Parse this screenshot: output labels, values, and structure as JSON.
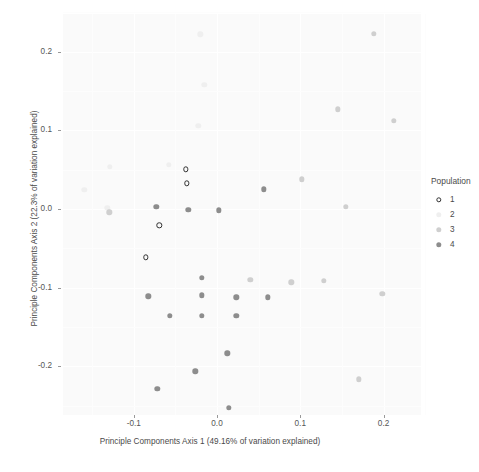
{
  "chart_data": {
    "type": "scatter",
    "title": "",
    "xlabel": "Principle Components Axis 1 (49.16% of variation explained)",
    "ylabel": "Principle Components Axis 2 (22.3% of variation explained)",
    "xlim": [
      -0.185,
      0.245
    ],
    "ylim": [
      -0.262,
      0.248
    ],
    "xticks": [
      -0.1,
      0.0,
      0.1,
      0.2
    ],
    "xticklabels": [
      "-0.1",
      "0.0",
      "0.1",
      "0.2"
    ],
    "yticks": [
      0.2,
      0.1,
      0.0,
      -0.1,
      -0.2
    ],
    "yticklabels": [
      "0.2",
      "0.1",
      "0.0",
      "-0.1",
      "-0.2"
    ],
    "grid": true,
    "legend": {
      "title": "Population",
      "position": "right",
      "entries": [
        {
          "label": "1",
          "marker": "open-circle",
          "color": "#303030"
        },
        {
          "label": "2",
          "marker": "filled-circle",
          "color": "#efefef"
        },
        {
          "label": "3",
          "marker": "filled-circle",
          "color": "#cfcfcf"
        },
        {
          "label": "4",
          "marker": "filled-circle",
          "color": "#8d8d8d"
        }
      ]
    },
    "series": [
      {
        "name": "1",
        "marker": "open-circle",
        "color": "#303030",
        "points": [
          {
            "x": -0.0375,
            "y": 0.0505
          },
          {
            "x": -0.0365,
            "y": 0.0325
          },
          {
            "x": -0.0695,
            "y": -0.0205
          },
          {
            "x": -0.0855,
            "y": -0.0615
          }
        ]
      },
      {
        "name": "2",
        "marker": "filled-circle",
        "color": "#efefef",
        "points": [
          {
            "x": -0.02,
            "y": 0.222
          },
          {
            "x": -0.0155,
            "y": 0.158
          },
          {
            "x": -0.0225,
            "y": 0.106
          },
          {
            "x": -0.058,
            "y": 0.056
          },
          {
            "x": -0.129,
            "y": 0.0535
          },
          {
            "x": -0.1595,
            "y": 0.0245
          },
          {
            "x": -0.132,
            "y": 0.0015
          }
        ]
      },
      {
        "name": "3",
        "marker": "filled-circle",
        "color": "#cfcfcf",
        "points": [
          {
            "x": 0.188,
            "y": 0.223
          },
          {
            "x": 0.145,
            "y": 0.127
          },
          {
            "x": 0.212,
            "y": 0.112
          },
          {
            "x": 0.102,
            "y": 0.038
          },
          {
            "x": 0.1545,
            "y": 0.003
          },
          {
            "x": -0.1295,
            "y": -0.004
          },
          {
            "x": 0.04,
            "y": -0.09
          },
          {
            "x": 0.089,
            "y": -0.093
          },
          {
            "x": 0.128,
            "y": -0.0915
          },
          {
            "x": 0.1985,
            "y": -0.108
          },
          {
            "x": 0.17,
            "y": -0.2165
          }
        ]
      },
      {
        "name": "4",
        "marker": "filled-circle",
        "color": "#8d8d8d",
        "points": [
          {
            "x": 0.056,
            "y": 0.025
          },
          {
            "x": -0.073,
            "y": 0.0025
          },
          {
            "x": -0.0345,
            "y": -0.001
          },
          {
            "x": 0.002,
            "y": -0.0015
          },
          {
            "x": -0.0185,
            "y": -0.0875
          },
          {
            "x": -0.0825,
            "y": -0.111
          },
          {
            "x": -0.018,
            "y": -0.11
          },
          {
            "x": 0.023,
            "y": -0.1125
          },
          {
            "x": 0.061,
            "y": -0.1125
          },
          {
            "x": -0.0565,
            "y": -0.136
          },
          {
            "x": -0.0185,
            "y": -0.1355
          },
          {
            "x": 0.023,
            "y": -0.136
          },
          {
            "x": 0.0125,
            "y": -0.1835
          },
          {
            "x": -0.026,
            "y": -0.2065
          },
          {
            "x": -0.0715,
            "y": -0.229
          },
          {
            "x": 0.014,
            "y": -0.253
          }
        ]
      }
    ]
  }
}
